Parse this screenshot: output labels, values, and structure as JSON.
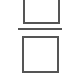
{
  "icon": {
    "name": "fraction-divide-icon",
    "stroke_color": "#555555",
    "background": "#ffffff",
    "parts": [
      "numerator-box",
      "fraction-bar",
      "denominator-box"
    ]
  }
}
